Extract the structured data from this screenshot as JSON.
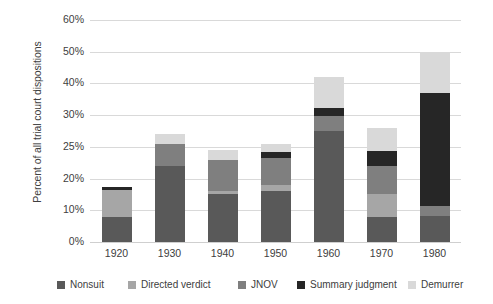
{
  "chart_data": {
    "type": "bar",
    "subtype": "stacked-bar",
    "title": "",
    "xlabel": "",
    "ylabel": "Percent of all trial court dispositions",
    "categories": [
      "1920",
      "1930",
      "1940",
      "1950",
      "1960",
      "1970",
      "1980"
    ],
    "ytick_labels": [
      "0%",
      "10%",
      "20%",
      "25%",
      "30%",
      "40%",
      "50%",
      "60%"
    ],
    "ytick_values": [
      0,
      10,
      20,
      25,
      30,
      40,
      50,
      60
    ],
    "ylim": [
      0,
      60
    ],
    "y_axis_note": "non-linear spacing: extra tick at 25%",
    "grid": true,
    "legend_position": "bottom",
    "series": [
      {
        "name": "Nonsuit",
        "color": "#595959",
        "values": [
          8.0,
          22.0,
          15.0,
          16.2,
          27.5,
          7.8,
          8.2
        ]
      },
      {
        "name": "Directed verdict",
        "color": "#a6a6a6",
        "values": [
          8.3,
          0.0,
          1.0,
          1.8,
          0.0,
          7.2,
          0.0
        ]
      },
      {
        "name": "JNOV",
        "color": "#7f7f7f",
        "values": [
          0.0,
          3.5,
          7.0,
          5.2,
          2.3,
          7.0,
          3.3
        ]
      },
      {
        "name": "Summary judgment",
        "color": "#262626",
        "values": [
          1.0,
          0.0,
          0.0,
          1.0,
          2.6,
          2.4,
          25.5
        ]
      },
      {
        "name": "Demurrer",
        "color": "#d9d9d9",
        "values": [
          0.0,
          1.5,
          1.5,
          1.3,
          9.6,
          3.6,
          13.0
        ]
      }
    ],
    "totals": [
      17.3,
      27.0,
      24.5,
      25.5,
      42.0,
      28.0,
      50.0
    ]
  },
  "legend": {
    "items": [
      {
        "label": "Nonsuit",
        "color": "#595959"
      },
      {
        "label": "Directed verdict",
        "color": "#a6a6a6"
      },
      {
        "label": "JNOV",
        "color": "#7f7f7f"
      },
      {
        "label": "Summary judgment",
        "color": "#262626"
      },
      {
        "label": "Demurrer",
        "color": "#d9d9d9"
      }
    ]
  }
}
